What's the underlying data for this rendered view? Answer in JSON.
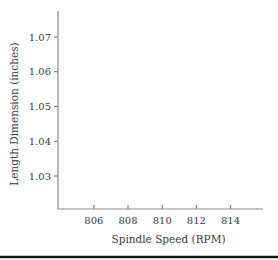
{
  "chart_data": {
    "type": "scatter",
    "title": "",
    "xlabel": "Spindle Speed (RPM)",
    "ylabel": "Length Dimension (inches)",
    "xlim": [
      803.9,
      815.9
    ],
    "ylim": [
      1.0205,
      1.0775
    ],
    "x_ticks": [
      806,
      808,
      810,
      812,
      814
    ],
    "x_tick_labels": [
      "806",
      "808",
      "810",
      "812",
      "814"
    ],
    "y_ticks": [
      1.03,
      1.04,
      1.05,
      1.06,
      1.07
    ],
    "y_tick_labels": [
      "1.03",
      "1.04",
      "1.05",
      "1.06",
      "1.07"
    ],
    "grid": false,
    "series": [],
    "legend": null
  }
}
